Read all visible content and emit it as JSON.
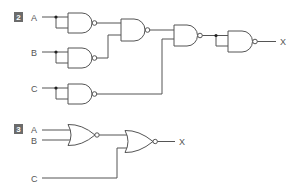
{
  "diagrams": [
    {
      "number": "2",
      "gate_type": "NAND",
      "inputs": [
        "A",
        "B",
        "C"
      ],
      "output": "X",
      "description": "Three NAND gates with tied inputs (inverters) on A, B, C; NAND of inverted A and inverted B; NAND of that with inverted C; final NAND with tied inputs (inverter) producing X"
    },
    {
      "number": "3",
      "gate_type": "NOR",
      "inputs": [
        "A",
        "B",
        "C"
      ],
      "output": "X",
      "description": "NOR of A and B feeds a second NOR together with C, producing X"
    }
  ],
  "labels": {
    "d2_badge": "2",
    "d2_a": "A",
    "d2_b": "B",
    "d2_c": "C",
    "d2_x": "X",
    "d3_badge": "3",
    "d3_a": "A",
    "d3_b": "B",
    "d3_c": "C",
    "d3_x": "X"
  },
  "colors": {
    "wire": "#555555",
    "badge": "#6b6b6b",
    "junction": "#222222"
  }
}
